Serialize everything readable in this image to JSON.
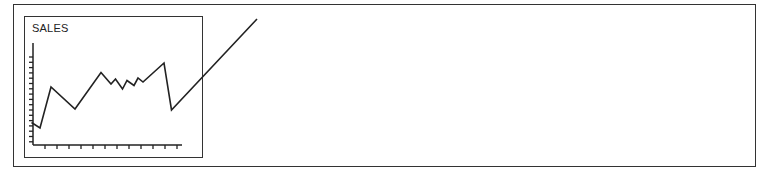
{
  "chart_data": {
    "type": "line",
    "title": "SALES",
    "xlabel": "",
    "ylabel": "",
    "grid": false,
    "x_ticks": 12,
    "y_ticks": 17,
    "points_px": [
      [
        31.5,
        122.5
      ],
      [
        40,
        128
      ],
      [
        51,
        87
      ],
      [
        75,
        109
      ],
      [
        101,
        72.5
      ],
      [
        111,
        84
      ],
      [
        115.5,
        79
      ],
      [
        122.5,
        89
      ],
      [
        127,
        80.5
      ],
      [
        134,
        85.5
      ],
      [
        138,
        78
      ],
      [
        143,
        82
      ],
      [
        164,
        63
      ],
      [
        171.5,
        110
      ],
      [
        257,
        19
      ]
    ],
    "values_relative": [
      23,
      17,
      58,
      36,
      72,
      61,
      66,
      56,
      64,
      59,
      67,
      63,
      82,
      35,
      126
    ],
    "note": "Line continues beyond chart frame toward upper right"
  },
  "colors": {
    "stroke": "#222222",
    "background": "#ffffff"
  }
}
